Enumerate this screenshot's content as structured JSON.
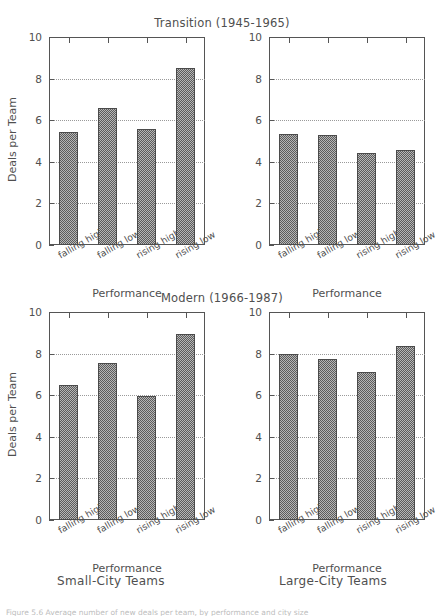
{
  "figure": {
    "width": 444,
    "height": 616,
    "background": "#ffffff",
    "ink_color": "#4f4f4f",
    "bar_fill": "#8c8c8c",
    "bar_edge": "#4b4b4b",
    "grid_color": "#9a9a9a",
    "truncated_caption": "Figure 5.6  Average number of new deals per team, by performance and city size"
  },
  "panel_captions": {
    "left": "Small-City Teams",
    "right": "Large-City Teams"
  },
  "axis": {
    "ylabel": "Deals per Team",
    "xlabel": "Performance",
    "yticks": [
      0,
      2,
      4,
      6,
      8,
      10
    ],
    "ylim": [
      0,
      10
    ],
    "categories": [
      "falling high",
      "falling low",
      "rising high",
      "rising low"
    ]
  },
  "chart_data": [
    {
      "id": "transition-small-city",
      "type": "bar",
      "title": "Transition (1945-1965)",
      "row": "Transition (1945-1965)",
      "column": "Small-City Teams",
      "xlabel": "Performance",
      "ylabel": "Deals per Team",
      "categories": [
        "falling high",
        "falling low",
        "rising high",
        "rising low"
      ],
      "values": [
        5.45,
        6.6,
        5.6,
        8.5
      ],
      "ylim": [
        0,
        10
      ],
      "yticks": [
        0,
        2,
        4,
        6,
        8,
        10
      ],
      "grid": true,
      "legend": "none"
    },
    {
      "id": "transition-large-city",
      "type": "bar",
      "title": "Transition (1945-1965)",
      "row": "Transition (1945-1965)",
      "column": "Large-City Teams",
      "xlabel": "Performance",
      "ylabel": "Deals per Team",
      "categories": [
        "falling high",
        "falling low",
        "rising high",
        "rising low"
      ],
      "values": [
        5.35,
        5.3,
        4.4,
        4.55
      ],
      "ylim": [
        0,
        10
      ],
      "yticks": [
        0,
        2,
        4,
        6,
        8,
        10
      ],
      "grid": true,
      "legend": "none"
    },
    {
      "id": "modern-small-city",
      "type": "bar",
      "title": "Modern (1966-1987)",
      "row": "Modern (1966-1987)",
      "column": "Small-City Teams",
      "xlabel": "Performance",
      "ylabel": "Deals per Team",
      "categories": [
        "falling high",
        "falling low",
        "rising high",
        "rising low"
      ],
      "values": [
        6.5,
        7.55,
        5.95,
        8.95
      ],
      "ylim": [
        0,
        10
      ],
      "yticks": [
        0,
        2,
        4,
        6,
        8,
        10
      ],
      "grid": true,
      "legend": "none"
    },
    {
      "id": "modern-large-city",
      "type": "bar",
      "title": "Modern (1966-1987)",
      "row": "Modern (1966-1987)",
      "column": "Large-City Teams",
      "xlabel": "Performance",
      "ylabel": "Deals per Team",
      "categories": [
        "falling high",
        "falling low",
        "rising high",
        "rising low"
      ],
      "values": [
        8.0,
        7.75,
        7.1,
        8.35
      ],
      "ylim": [
        0,
        10
      ],
      "yticks": [
        0,
        2,
        4,
        6,
        8,
        10
      ],
      "grid": true,
      "legend": "none"
    }
  ]
}
